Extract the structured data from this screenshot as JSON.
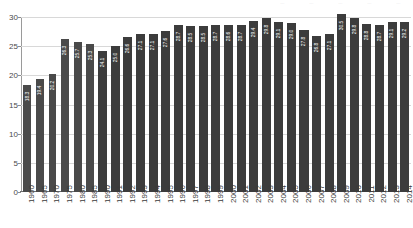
{
  "header": {
    "fragments": [
      "...",
      "...",
      "...",
      "...",
      "..."
    ]
  },
  "chart_data": {
    "type": "bar",
    "title": "",
    "subtitle": "",
    "xlabel": "",
    "ylabel": "",
    "ylim": [
      0,
      30
    ],
    "yticks": [
      0,
      5,
      10,
      15,
      20,
      25,
      30
    ],
    "grid": true,
    "legend": "none",
    "categories": [
      "1960",
      "1965",
      "1970",
      "1975",
      "1980",
      "1985",
      "1990",
      "1991",
      "1992",
      "1993",
      "1994",
      "1995",
      "1996",
      "1997",
      "1998",
      "1999",
      "2000",
      "2001",
      "2002",
      "2003",
      "2004",
      "2005",
      "2006",
      "2007",
      "2008",
      "2009",
      "2010",
      "2011",
      "2012",
      "2013",
      "2014"
    ],
    "values": [
      18.3,
      19.4,
      20.2,
      26.3,
      25.7,
      25.3,
      24.1,
      25.0,
      26.6,
      27.1,
      27.1,
      27.6,
      28.7,
      28.5,
      28.5,
      28.7,
      28.6,
      28.7,
      29.4,
      29.8,
      29.1,
      29.0,
      27.8,
      26.8,
      27.1,
      30.5,
      29.8,
      28.8,
      28.7,
      29.1,
      29.2
    ],
    "value_labels": [
      "18.3",
      "19.4",
      "20.2",
      "26.3",
      "25.7",
      "25.3",
      "24.1",
      "25.0",
      "26.6",
      "27.1",
      "27.1",
      "27.6",
      "28.7",
      "28.5",
      "28.5",
      "28.7",
      "28.6",
      "28.7",
      "29.4",
      "29.8",
      "29.1",
      "29.0",
      "27.8",
      "26.8",
      "27.1",
      "30.5",
      "29.8",
      "28.8",
      "28.7",
      "29.1",
      "29.2"
    ],
    "series_groups": [
      {
        "name": "five-year-interval",
        "range": [
          0,
          5
        ],
        "color": "#4a4a4a"
      },
      {
        "name": "annual",
        "range": [
          6,
          30
        ],
        "color": "#3c3c3c"
      }
    ],
    "colors": {
      "bar_annual": "#3c3c3c",
      "bar_interval": "#4a4a4a",
      "gridline": "#d8d8d8",
      "axis": "#6f6f6f",
      "tick_text": "#4a4a4a",
      "value_label": "#ffffff",
      "background": "#ffffff"
    }
  }
}
